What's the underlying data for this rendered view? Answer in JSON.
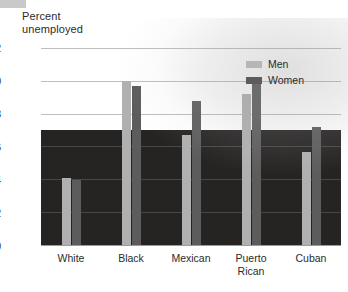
{
  "chart_data": {
    "type": "bar",
    "title": "",
    "ylabel": "Percent\nunemployed",
    "xlabel": "",
    "categories": [
      "White",
      "Black",
      "Mexican",
      "Puerto\nRican",
      "Cuban"
    ],
    "series": [
      {
        "name": "Men",
        "color": "#b0b0b0",
        "values": [
          4.1,
          10.0,
          6.7,
          9.2,
          5.7
        ]
      },
      {
        "name": "Women",
        "color": "#5c5c5c",
        "values": [
          4.0,
          9.7,
          8.8,
          10.0,
          7.2
        ]
      }
    ],
    "ylim": [
      0,
      12
    ],
    "yticks": [
      "0",
      "2",
      "4",
      "6",
      "8",
      "10",
      "12"
    ],
    "grid": true,
    "legend_position": "top-right"
  },
  "legend": {
    "items": [
      {
        "label": "Men"
      },
      {
        "label": "Women"
      }
    ]
  }
}
